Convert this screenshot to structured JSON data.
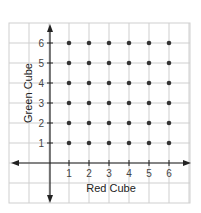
{
  "chart_data": {
    "type": "scatter",
    "title": "",
    "xlabel": "Red Cube",
    "ylabel": "Green Cube",
    "x_ticks": [
      "1",
      "2",
      "3",
      "4",
      "5",
      "6"
    ],
    "y_ticks": [
      "1",
      "2",
      "3",
      "4",
      "5",
      "6"
    ],
    "xlim": [
      -2,
      7
    ],
    "ylim": [
      -2,
      7
    ],
    "grid": true,
    "legend": null,
    "points": [
      [
        1,
        1
      ],
      [
        2,
        1
      ],
      [
        3,
        1
      ],
      [
        4,
        1
      ],
      [
        5,
        1
      ],
      [
        6,
        1
      ],
      [
        1,
        2
      ],
      [
        2,
        2
      ],
      [
        3,
        2
      ],
      [
        4,
        2
      ],
      [
        5,
        2
      ],
      [
        6,
        2
      ],
      [
        1,
        3
      ],
      [
        2,
        3
      ],
      [
        3,
        3
      ],
      [
        4,
        3
      ],
      [
        5,
        3
      ],
      [
        6,
        3
      ],
      [
        1,
        4
      ],
      [
        2,
        4
      ],
      [
        3,
        4
      ],
      [
        4,
        4
      ],
      [
        5,
        4
      ],
      [
        6,
        4
      ],
      [
        1,
        5
      ],
      [
        2,
        5
      ],
      [
        3,
        5
      ],
      [
        4,
        5
      ],
      [
        5,
        5
      ],
      [
        6,
        5
      ],
      [
        1,
        6
      ],
      [
        2,
        6
      ],
      [
        3,
        6
      ],
      [
        4,
        6
      ],
      [
        5,
        6
      ],
      [
        6,
        6
      ]
    ]
  },
  "colors": {
    "grid": "#cfcfcf",
    "axis": "#222222",
    "point": "#333333"
  }
}
